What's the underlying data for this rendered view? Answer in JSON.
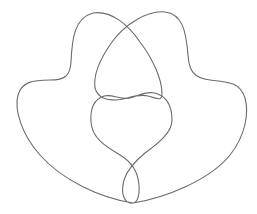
{
  "diagram": {
    "type": "knot-diagram",
    "stroke_color": "#6b6b6b",
    "background_color": "#ffffff",
    "crossings_visible": 5
  }
}
